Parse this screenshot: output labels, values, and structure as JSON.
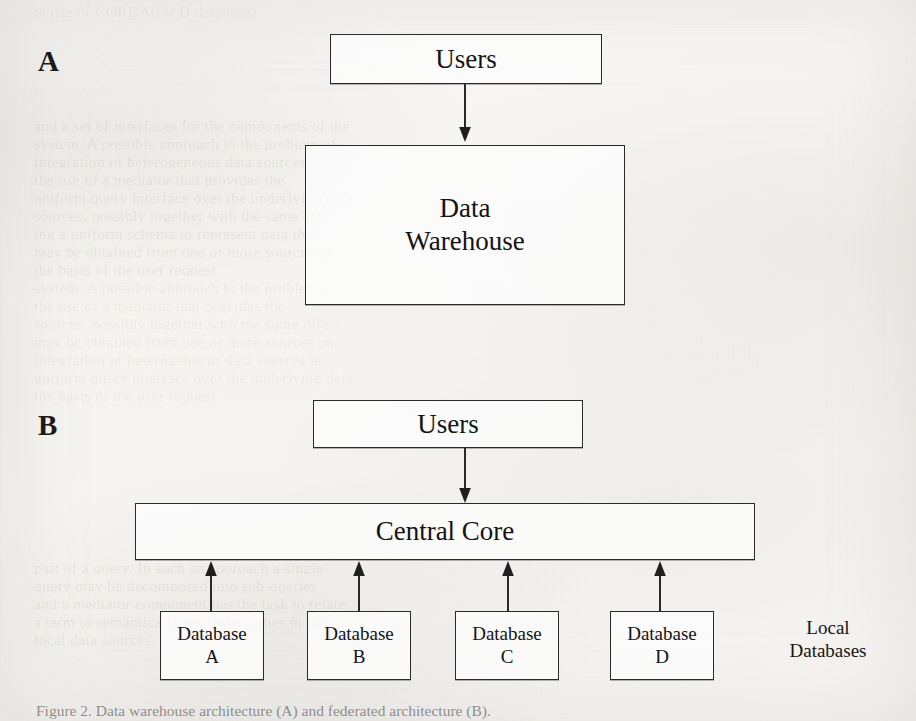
{
  "figure": {
    "panels": [
      {
        "id": "A",
        "label": "A"
      },
      {
        "id": "B",
        "label": "B"
      }
    ],
    "panel_a": {
      "users_box": "Users",
      "warehouse_box": "Data\nWarehouse",
      "arrow": "users-to-warehouse-arrow-down"
    },
    "panel_b": {
      "users_box": "Users",
      "core_box": "Central Core",
      "side_label": "Local\nDatabases",
      "databases": [
        "Database\nA",
        "Database\nB",
        "Database\nC",
        "Database\nD"
      ],
      "arrow_down": "users-to-core-arrow-down",
      "arrows_up": [
        "database-a-to-core-arrow-up",
        "database-b-to-core-arrow-up",
        "database-c-to-core-arrow-up",
        "database-d-to-core-arrow-up"
      ]
    },
    "caption": "Figure 2. Data warehouse architecture (A) and federated architecture (B)."
  },
  "colors": {
    "ink": "#141414",
    "paper": "#f6f5f3",
    "rule": "#2a2a2a"
  },
  "bleed_through": {
    "note": "faint mirrored text from the reverse of the scanned page",
    "lines": [
      "te  iste  of  CORBA(for D database)",
      "",
      "and a set of interfaces for the components of the",
      "system. A possible  approach to the problem of",
      "integration  of  heterogeneous  data  sources  is",
      "the use of a mediator that provides the",
      "uniform query interface over the underlying data",
      "sources, possibly together with the same offer-",
      "ing  a  uniform  schema  to  represent  data  that",
      "may be obtained from one or more sources on",
      "the basis of the user request.",
      "",
      "",
      "",
      "",
      "",
      "",
      "",
      "",
      "",
      "",
      "",
      "",
      "",
      "",
      "",
      "",
      "",
      "",
      "",
      "",
      "",
      "",
      "in order to produce new data for answering a",
      "part of a query. In such  an  approach  a single",
      "query  may  be  decomposed  into  sub-queries",
      "and a mediator component has the task to relate",
      "a  term  to  semantically  equivalent  ones  in  the",
      "local data sources."
    ]
  }
}
